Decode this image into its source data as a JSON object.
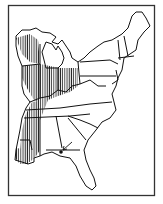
{
  "map": {
    "type": "range-map",
    "region": "Eastern United States",
    "colors": {
      "background": "#ffffff",
      "ink": "#111111",
      "frame": "#333333"
    },
    "legend": [],
    "features": {
      "hatched_range": "vertical hatching over Wisconsin, Illinois, Indiana, western Ohio, western Kentucky/Tennessee, Mississippi, Louisiana",
      "marker": "dot with arrow in southern Georgia / Florida panhandle border"
    }
  }
}
